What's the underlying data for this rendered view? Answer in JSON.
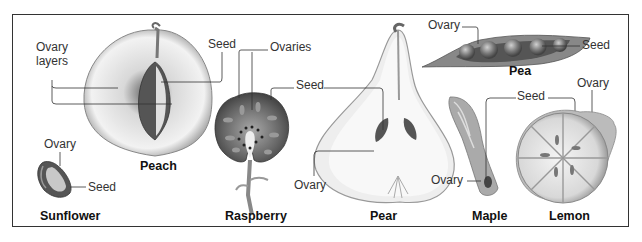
{
  "diagram": {
    "type": "labeled-illustration",
    "fruits": [
      {
        "name": "Peach",
        "labels": [
          "Ovary layers",
          "Seed"
        ]
      },
      {
        "name": "Sunflower",
        "labels": [
          "Ovary",
          "Seed"
        ]
      },
      {
        "name": "Raspberry",
        "labels": [
          "Ovaries",
          "Seed"
        ]
      },
      {
        "name": "Pear",
        "labels": [
          "Seed",
          "Ovary"
        ]
      },
      {
        "name": "Pea",
        "labels": [
          "Ovary",
          "Seed"
        ]
      },
      {
        "name": "Maple",
        "labels": [
          "Seed",
          "Ovary"
        ]
      },
      {
        "name": "Lemon",
        "labels": [
          "Ovary",
          "Seed"
        ]
      }
    ]
  },
  "labels": {
    "peach_ovary_layers_1": "Ovary",
    "peach_ovary_layers_2": "layers",
    "peach_seed": "Seed",
    "peach_name": "Peach",
    "sunflower_ovary": "Ovary",
    "sunflower_seed": "Seed",
    "sunflower_name": "Sunflower",
    "raspberry_ovaries": "Ovaries",
    "raspberry_seed": "Seed",
    "raspberry_name": "Raspberry",
    "pear_ovary": "Ovary",
    "pear_name": "Pear",
    "pea_ovary": "Ovary",
    "pea_seed": "Seed",
    "pea_name": "Pea",
    "maple_lemon_seed": "Seed",
    "maple_ovary": "Ovary",
    "maple_name": "Maple",
    "lemon_ovary": "Ovary",
    "lemon_name": "Lemon"
  }
}
